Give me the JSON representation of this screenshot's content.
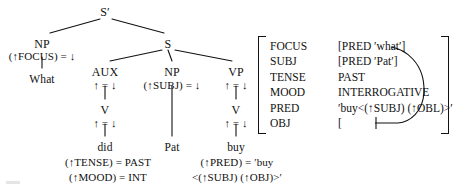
{
  "figure": {
    "kind": "lfg-cstructure-fstructure",
    "caption": ""
  },
  "tree": {
    "nodes": [
      {
        "id": "sbar",
        "label": "S′",
        "x": 105,
        "y": 6,
        "type": "cat"
      },
      {
        "id": "np-focus",
        "label": "NP",
        "x": 42,
        "y": 38,
        "type": "cat"
      },
      {
        "id": "s",
        "label": "S",
        "x": 168,
        "y": 38,
        "type": "cat"
      },
      {
        "id": "aux",
        "label": "AUX",
        "x": 105,
        "y": 66,
        "type": "cat"
      },
      {
        "id": "np-subj",
        "label": "NP",
        "x": 172,
        "y": 66,
        "type": "cat"
      },
      {
        "id": "vp",
        "label": "VP",
        "x": 236,
        "y": 66,
        "type": "cat"
      },
      {
        "id": "v-aux",
        "label": "V",
        "x": 105,
        "y": 104,
        "type": "cat"
      },
      {
        "id": "v-main",
        "label": "V",
        "x": 236,
        "y": 104,
        "type": "cat"
      }
    ],
    "annotations": [
      {
        "id": "ann-focus",
        "label": "(↑FOCUS) = ↓",
        "x": 42,
        "y": 50,
        "type": "annot"
      },
      {
        "id": "ann-aux",
        "label": "↑ = ↓",
        "x": 105,
        "y": 79,
        "type": "annot"
      },
      {
        "id": "ann-subj",
        "label": "(↑SUBJ) = ↓",
        "x": 172,
        "y": 79,
        "type": "annot"
      },
      {
        "id": "ann-vp",
        "label": "↑ = ↓",
        "x": 236,
        "y": 79,
        "type": "annot"
      },
      {
        "id": "ann-v-aux",
        "label": "↑ = ↓",
        "x": 105,
        "y": 117,
        "type": "annot"
      },
      {
        "id": "ann-v-main",
        "label": "↑ = ↓",
        "x": 236,
        "y": 117,
        "type": "annot"
      }
    ],
    "words": [
      {
        "id": "w-what",
        "label": "What",
        "x": 42,
        "y": 73,
        "type": "word"
      },
      {
        "id": "w-did",
        "label": "did",
        "x": 105,
        "y": 141,
        "type": "word"
      },
      {
        "id": "w-pat",
        "label": "Pat",
        "x": 172,
        "y": 141,
        "type": "word"
      },
      {
        "id": "w-buy",
        "label": "buy",
        "x": 236,
        "y": 141,
        "type": "word"
      }
    ],
    "lexical_entries": [
      {
        "id": "lex-did-1",
        "label": "(↑TENSE) = PAST",
        "x": 108,
        "y": 156,
        "type": "lex"
      },
      {
        "id": "lex-did-2",
        "label": "(↑MOOD) = INT",
        "x": 108,
        "y": 171,
        "type": "lex"
      },
      {
        "id": "lex-buy-1",
        "label": "(↑PRED) = ′buy",
        "x": 237,
        "y": 156,
        "type": "lex"
      },
      {
        "id": "lex-buy-2",
        "label": "<(↑SUBJ)  (↑OBJ)>′",
        "x": 237,
        "y": 171,
        "type": "lex"
      }
    ],
    "edges": [
      {
        "id": "e-sbar-np",
        "x1": 100,
        "y1": 19,
        "x2": 50,
        "y2": 33
      },
      {
        "id": "e-sbar-s",
        "x1": 112,
        "y1": 19,
        "x2": 164,
        "y2": 33
      },
      {
        "id": "e-np-what",
        "x1": 42,
        "y1": 57,
        "x2": 42,
        "y2": 68
      },
      {
        "id": "e-s-aux",
        "x1": 162,
        "y1": 50,
        "x2": 110,
        "y2": 61
      },
      {
        "id": "e-s-np",
        "x1": 168,
        "y1": 50,
        "x2": 172,
        "y2": 61
      },
      {
        "id": "e-s-vp",
        "x1": 175,
        "y1": 50,
        "x2": 232,
        "y2": 61
      },
      {
        "id": "e-aux-v",
        "x1": 105,
        "y1": 86,
        "x2": 105,
        "y2": 99
      },
      {
        "id": "e-vp-v",
        "x1": 236,
        "y1": 86,
        "x2": 236,
        "y2": 99
      },
      {
        "id": "e-v-did",
        "x1": 105,
        "y1": 124,
        "x2": 105,
        "y2": 136
      },
      {
        "id": "e-np-pat",
        "x1": 172,
        "y1": 86,
        "x2": 172,
        "y2": 136
      },
      {
        "id": "e-v-buy",
        "x1": 236,
        "y1": 124,
        "x2": 236,
        "y2": 136
      }
    ]
  },
  "fstructure": {
    "rows": [
      {
        "attribute": "FOCUS",
        "value": "[PRED  ′what′]"
      },
      {
        "attribute": "SUBJ",
        "value": "[PRED  ′Pat′]"
      },
      {
        "attribute": "TENSE",
        "value": "PAST"
      },
      {
        "attribute": "MOOD",
        "value": "INTERROGATIVE"
      },
      {
        "attribute": "PRED",
        "value": "′buy<(↑SUBJ) (↑OBL)>′"
      },
      {
        "attribute": "OBJ",
        "value": "["
      }
    ]
  },
  "colors": {
    "ink": "#111111",
    "background": "#ffffff"
  }
}
